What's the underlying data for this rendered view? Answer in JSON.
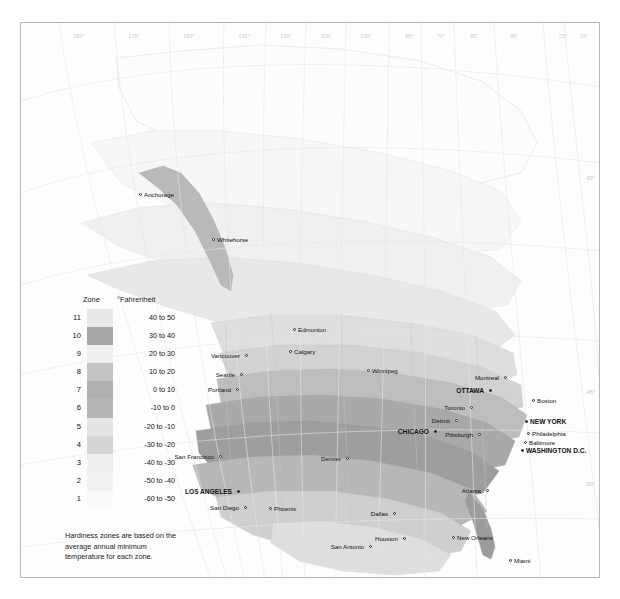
{
  "frame": {
    "longitude_labels": [
      {
        "text": "180°",
        "x": 58
      },
      {
        "text": "170°",
        "x": 113
      },
      {
        "text": "160°",
        "x": 168
      },
      {
        "text": "145°",
        "x": 223
      },
      {
        "text": "130°",
        "x": 265
      },
      {
        "text": "115°",
        "x": 305
      },
      {
        "text": "100°",
        "x": 345
      },
      {
        "text": "85°",
        "x": 388
      },
      {
        "text": "70°",
        "x": 420
      },
      {
        "text": "55°",
        "x": 453
      },
      {
        "text": "40°",
        "x": 493
      },
      {
        "text": "25°",
        "x": 542
      },
      {
        "text": "15°",
        "x": 563
      }
    ],
    "latitude_labels": [
      {
        "text": "60°",
        "y": 152
      },
      {
        "text": "45°",
        "y": 366
      },
      {
        "text": "30°",
        "y": 458
      }
    ]
  },
  "legend": {
    "header_zone": "Zone",
    "header_unit": "°Fahrenheit",
    "rows": [
      {
        "zone": "11",
        "range": "40 to 50",
        "color": "#e9e9e9"
      },
      {
        "zone": "10",
        "range": "30 to 40",
        "color": "#a8a8a8"
      },
      {
        "zone": "9",
        "range": "20 to 30",
        "color": "#efefef"
      },
      {
        "zone": "8",
        "range": "10 to 20",
        "color": "#c4c4c4"
      },
      {
        "zone": "7",
        "range": "0 to 10",
        "color": "#b0b0b0"
      },
      {
        "zone": "6",
        "range": "-10 to 0",
        "color": "#b6b6b6"
      },
      {
        "zone": "5",
        "range": "-20 to -10",
        "color": "#e4e4e4"
      },
      {
        "zone": "4",
        "range": "-30 to -20",
        "color": "#d6d6d6"
      },
      {
        "zone": "3",
        "range": "-40 to -30",
        "color": "#efefef"
      },
      {
        "zone": "2",
        "range": "-50 to -40",
        "color": "#f2f2f2"
      },
      {
        "zone": "1",
        "range": "-60 to -50",
        "color": "#fafafa"
      }
    ],
    "note": "Hardiness zones are based on the average annual minimum temperature for each zone."
  },
  "cities": [
    {
      "name": "Anchorage",
      "x": 118,
      "y": 170,
      "side": "right",
      "major": false
    },
    {
      "name": "Whitehorse",
      "x": 191,
      "y": 215,
      "side": "right",
      "major": false
    },
    {
      "name": "Edmonton",
      "x": 272,
      "y": 305,
      "side": "right",
      "major": false
    },
    {
      "name": "Calgary",
      "x": 268,
      "y": 327,
      "side": "right",
      "major": false
    },
    {
      "name": "Winnipeg",
      "x": 346,
      "y": 346,
      "side": "right",
      "major": false
    },
    {
      "name": "Vancouver",
      "x": 224,
      "y": 331,
      "side": "left",
      "major": false
    },
    {
      "name": "Seattle",
      "x": 219,
      "y": 350,
      "side": "left",
      "major": false
    },
    {
      "name": "Portland",
      "x": 215,
      "y": 365,
      "side": "left",
      "major": false
    },
    {
      "name": "San Francisco",
      "x": 198,
      "y": 432,
      "side": "left",
      "major": false
    },
    {
      "name": "LOS ANGELES",
      "x": 216,
      "y": 467,
      "side": "left",
      "major": true
    },
    {
      "name": "San Diego",
      "x": 223,
      "y": 483,
      "side": "left",
      "major": false
    },
    {
      "name": "Phoenix",
      "x": 248,
      "y": 484,
      "side": "right",
      "major": false
    },
    {
      "name": "Denver",
      "x": 325,
      "y": 434,
      "side": "left",
      "major": false
    },
    {
      "name": "San Antonio",
      "x": 348,
      "y": 522,
      "side": "left",
      "major": false
    },
    {
      "name": "Dallas",
      "x": 372,
      "y": 489,
      "side": "left",
      "major": false
    },
    {
      "name": "Houston",
      "x": 382,
      "y": 514,
      "side": "left",
      "major": false
    },
    {
      "name": "New Orleans",
      "x": 431,
      "y": 513,
      "side": "right",
      "major": false
    },
    {
      "name": "CHICAGO",
      "x": 413,
      "y": 407,
      "side": "left",
      "major": true
    },
    {
      "name": "Detroit",
      "x": 434,
      "y": 396,
      "side": "left",
      "major": false
    },
    {
      "name": "Pittsburgh",
      "x": 457,
      "y": 410,
      "side": "left",
      "major": false
    },
    {
      "name": "Toronto",
      "x": 449,
      "y": 383,
      "side": "left",
      "major": false
    },
    {
      "name": "OTTAWA",
      "x": 468,
      "y": 366,
      "side": "left",
      "major": true
    },
    {
      "name": "Montreal",
      "x": 483,
      "y": 353,
      "side": "left",
      "major": false
    },
    {
      "name": "Boston",
      "x": 511,
      "y": 376,
      "side": "right",
      "major": false
    },
    {
      "name": "NEW YORK",
      "x": 504,
      "y": 397,
      "side": "right",
      "major": true
    },
    {
      "name": "Philadelphia",
      "x": 506,
      "y": 409,
      "side": "right",
      "major": false
    },
    {
      "name": "Baltimore",
      "x": 503,
      "y": 418,
      "side": "right",
      "major": false
    },
    {
      "name": "WASHINGTON D.C.",
      "x": 500,
      "y": 426,
      "side": "right",
      "major": true
    },
    {
      "name": "Atlanta",
      "x": 465,
      "y": 466,
      "side": "left",
      "major": false
    },
    {
      "name": "Miami",
      "x": 488,
      "y": 536,
      "side": "right",
      "major": false
    }
  ]
}
